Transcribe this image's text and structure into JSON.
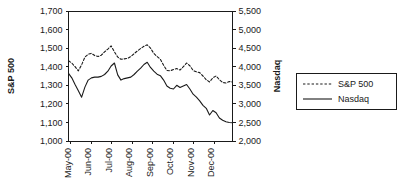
{
  "chart_data": {
    "type": "line",
    "title": "",
    "xlabel": "",
    "ylabel": "S&P 500",
    "y2label": "Nasdaq",
    "grid": false,
    "legend_position": "right-outside",
    "x_tick_labels": [
      "May-00",
      "Jun-00",
      "Jul-00",
      "Aug-00",
      "Sep-00",
      "Oct-00",
      "Nov-00",
      "Dec-00"
    ],
    "y_tick_labels": [
      "1,000",
      "1,100",
      "1,200",
      "1,300",
      "1,400",
      "1,500",
      "1,600",
      "1,700"
    ],
    "y2_tick_labels": [
      "2,000",
      "2,500",
      "3,000",
      "3,500",
      "4,000",
      "4,500",
      "5,000",
      "5,500"
    ],
    "ylim": [
      1000,
      1700
    ],
    "y2lim": [
      2000,
      5500
    ],
    "xlim": [
      "May-00",
      "Dec-00"
    ],
    "series": [
      {
        "name": "S&P 500",
        "axis": "left",
        "style": "dashed",
        "color": "#1a1a1a",
        "values": [
          1432,
          1420,
          1400,
          1378,
          1410,
          1452,
          1467,
          1472,
          1460,
          1455,
          1462,
          1480,
          1495,
          1512,
          1480,
          1452,
          1440,
          1442,
          1445,
          1455,
          1470,
          1485,
          1498,
          1510,
          1518,
          1500,
          1472,
          1455,
          1440,
          1408,
          1380,
          1378,
          1385,
          1390,
          1382,
          1400,
          1420,
          1405,
          1380,
          1372,
          1368,
          1350,
          1330,
          1318,
          1340,
          1350,
          1330,
          1315,
          1312,
          1320,
          1318
        ]
      },
      {
        "name": "Nasdaq",
        "axis": "right",
        "style": "solid",
        "color": "#1a1a1a",
        "values": [
          3820,
          3700,
          3520,
          3350,
          3180,
          3450,
          3640,
          3700,
          3720,
          3720,
          3740,
          3790,
          3880,
          4020,
          4100,
          3780,
          3640,
          3680,
          3700,
          3720,
          3790,
          3880,
          3960,
          4060,
          4120,
          3980,
          3880,
          3800,
          3760,
          3640,
          3480,
          3420,
          3400,
          3500,
          3440,
          3480,
          3520,
          3400,
          3260,
          3180,
          3080,
          2960,
          2880,
          2700,
          2820,
          2760,
          2620,
          2560,
          2520,
          2500,
          2490
        ]
      }
    ],
    "legend": [
      {
        "label": "S&P 500",
        "style": "dashed"
      },
      {
        "label": "Nasdaq",
        "style": "solid"
      }
    ]
  },
  "axes": {
    "left_title": "S&P 500",
    "right_title": "Nasdaq"
  }
}
